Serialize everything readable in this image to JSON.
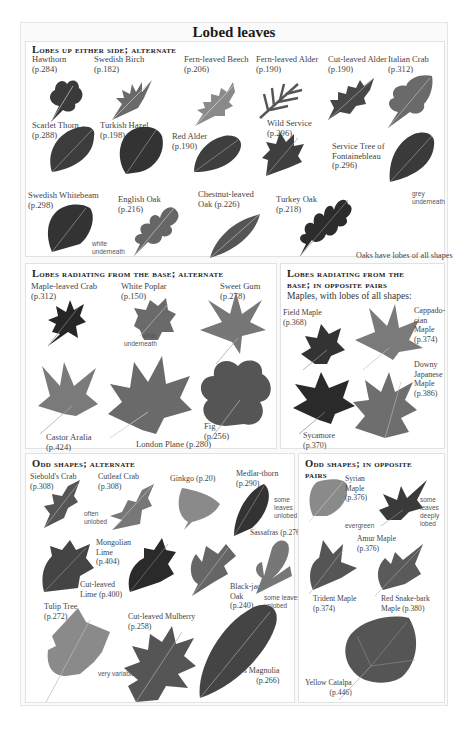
{
  "title": "Lobed leaves",
  "colors": {
    "page_bg": "#fafafa",
    "box_border": "#e2e2e2",
    "leaf_dark": "#2f2f2f",
    "leaf_mid": "#5a5a5a",
    "leaf_light": "#8a8a8a"
  },
  "sections": {
    "s1": {
      "heading": "Lobes up either side; alternate",
      "items": [
        {
          "name": "Hawthorn",
          "page": "(p.284)"
        },
        {
          "name": "Swedish Birch",
          "page": "(p.182)"
        },
        {
          "name": "Fern-leaved Beech",
          "page": "(p.206)"
        },
        {
          "name": "Fern-leaved Alder",
          "page": "(p.190)"
        },
        {
          "name": "Cut-leaved Alder",
          "page": "(p.190)"
        },
        {
          "name": "Italian Crab",
          "page": "(p.312)"
        },
        {
          "name": "Scarlet Thorn",
          "page": "(p.288)"
        },
        {
          "name": "Turkish Hazel",
          "page": "(p.198)"
        },
        {
          "name": "Red Alder",
          "page": "(p.190)"
        },
        {
          "name": "Wild Service",
          "page": "(p.296)"
        },
        {
          "name": "Service Tree of\nFontainebleau",
          "page": "(p.296)"
        },
        {
          "name": "Swedish Whitebeam",
          "page": "(p.298)"
        },
        {
          "name": "English Oak",
          "page": "(p.216)"
        },
        {
          "name": "Chestnut-leaved\nOak (p.226)",
          "page": ""
        },
        {
          "name": "Turkey Oak",
          "page": "(p.218)"
        }
      ],
      "notes": {
        "whitebeam": "white\nunderneath",
        "fontainebleau": "grey\nunderneath",
        "oaks": "Oaks have lobes of all shapes"
      }
    },
    "s2a": {
      "heading": "Lobes radiating from the base; alternate",
      "items": [
        {
          "name": "Maple-leaved Crab",
          "page": "(p.312)"
        },
        {
          "name": "White Poplar",
          "page": "(p.150)"
        },
        {
          "name": "Sweet Gum",
          "page": "(p.278)"
        },
        {
          "name": "Castor Aralia",
          "page": "(p.424)"
        },
        {
          "name": "London Plane (p.280)",
          "page": ""
        },
        {
          "name": "Fig",
          "page": "(p.256)"
        }
      ],
      "notes": {
        "poplar": "white\nunderneath"
      }
    },
    "s2b": {
      "heading_line1": "Lobes radiating from the",
      "heading_line2": "base; in opposite pairs",
      "subtitle": "Maples, with lobes of all shapes:",
      "items": [
        {
          "name": "Field Maple",
          "page": "(p.368)"
        },
        {
          "name": "Cappado-\ncian\nMaple",
          "page": "(p.374)"
        },
        {
          "name": "Downy\nJapanese\nMaple",
          "page": "(p.386)"
        },
        {
          "name": "Sycamore",
          "page": "(p.370)"
        }
      ]
    },
    "s3a": {
      "heading": "Odd shapes; alternate",
      "items": [
        {
          "name": "Siebold's Crab",
          "page": "(p.308)"
        },
        {
          "name": "Cutleaf Crab",
          "page": "(p.308)"
        },
        {
          "name": "Ginkgo (p.20)",
          "page": ""
        },
        {
          "name": "Medlar-thorn",
          "page": "(p.290)"
        },
        {
          "name": "Sassafras (p.276)",
          "page": ""
        },
        {
          "name": "Mongolian\nLime\n(p.404)",
          "page": ""
        },
        {
          "name": "Cut-leaved\nLime (p.400)",
          "page": ""
        },
        {
          "name": "Black-jack\nOak\n(p.240)",
          "page": ""
        },
        {
          "name": "Tulip Tree",
          "page": "(p.272)"
        },
        {
          "name": "Cut-leaved Mulberry",
          "page": "(p.258)"
        },
        {
          "name": "Sargent's Magnolia",
          "page": "(p.266)"
        }
      ],
      "notes": {
        "often": "often\nunlobed",
        "medlar": "some\nleaves\nunlobed",
        "sassafras": "some leaves\nunlobed",
        "mulberry": "very variable"
      }
    },
    "s3b": {
      "heading_line1": "Odd shapes; in opposite",
      "heading_line2": "pairs",
      "items": [
        {
          "name": "Syrian\nMaple\n(p.376)",
          "page": ""
        },
        {
          "name": "Amur Maple",
          "page": "(p.376)"
        },
        {
          "name": "Trident Maple",
          "page": "(p.374)"
        },
        {
          "name": "Red Snake-bark\nMaple (p.380)",
          "page": ""
        },
        {
          "name": "Yellow Catalpa",
          "page": "(p.446)"
        }
      ],
      "notes": {
        "evergreen": "evergreen",
        "deeply": "some\nleaves\ndeeply\nlobed"
      }
    }
  }
}
